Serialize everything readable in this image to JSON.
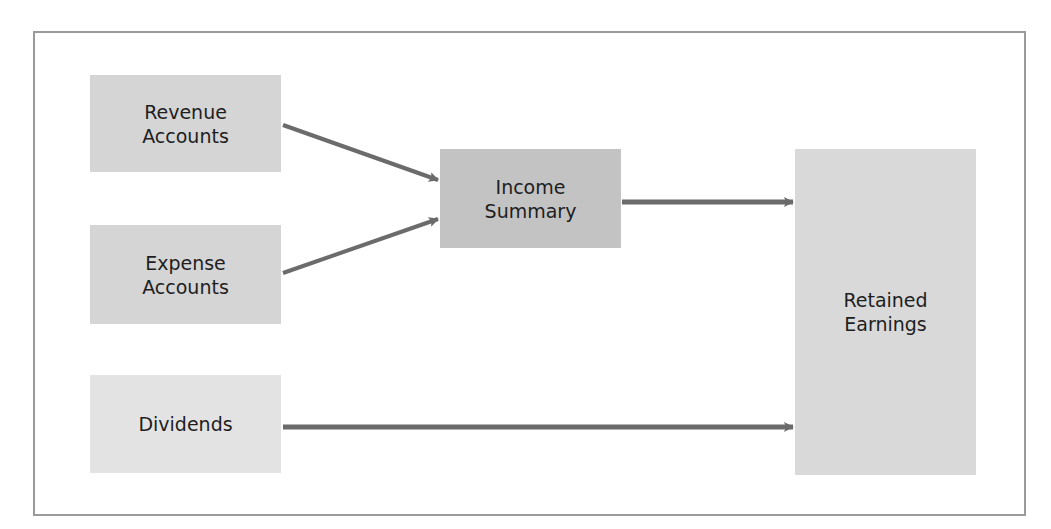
{
  "diagram": {
    "nodes": [
      {
        "id": "revenue",
        "lines": [
          "Revenue",
          "Accounts"
        ],
        "color": "#d5d5d5",
        "x": 90,
        "y": 75,
        "w": 191,
        "h": 97
      },
      {
        "id": "expense",
        "lines": [
          "Expense",
          "Accounts"
        ],
        "color": "#d5d5d5",
        "x": 90,
        "y": 225,
        "w": 191,
        "h": 99
      },
      {
        "id": "dividends",
        "lines": [
          "Dividends"
        ],
        "color": "#e3e3e3",
        "x": 90,
        "y": 375,
        "w": 191,
        "h": 98
      },
      {
        "id": "income_summary",
        "lines": [
          "Income",
          "Summary"
        ],
        "color": "#c3c3c3",
        "x": 440,
        "y": 149,
        "w": 181,
        "h": 99
      },
      {
        "id": "retained_earnings",
        "lines": [
          "Retained",
          "Earnings"
        ],
        "color": "#d9d9d9",
        "x": 795,
        "y": 149,
        "w": 181,
        "h": 326
      }
    ],
    "edges": [
      {
        "from": "revenue",
        "to": "income_summary"
      },
      {
        "from": "expense",
        "to": "income_summary"
      },
      {
        "from": "income_summary",
        "to": "retained_earnings"
      },
      {
        "from": "dividends",
        "to": "retained_earnings"
      }
    ],
    "arrow_color": "#6b6b6b"
  }
}
